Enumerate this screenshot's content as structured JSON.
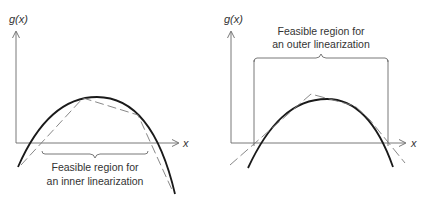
{
  "colors": {
    "axis": "#6a6a6a",
    "curve": "#1a1a1a",
    "linearization": "#7a7a7a",
    "text": "#333333",
    "background": "#ffffff"
  },
  "left_panel": {
    "y_axis_label": "g(x)",
    "x_axis_label": "x",
    "caption_line1": "Feasible region for",
    "caption_line2": "an inner linearization",
    "linearization_type": "inner (piecewise-linear chords below concave function)"
  },
  "right_panel": {
    "y_axis_label": "g(x)",
    "x_axis_label": "x",
    "caption_line1": "Feasible region for",
    "caption_line2": "an outer linearization",
    "linearization_type": "outer (tangent lines above concave function)"
  }
}
